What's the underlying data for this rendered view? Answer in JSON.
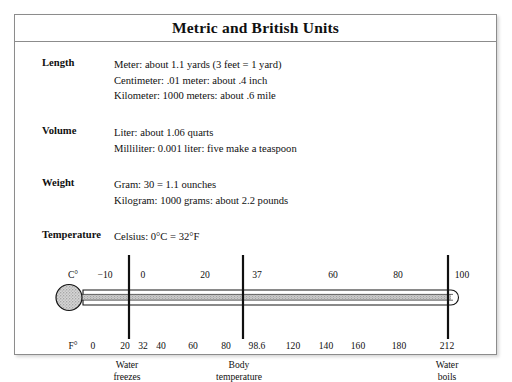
{
  "document": {
    "title": "Metric and British Units"
  },
  "groups": [
    {
      "label": "Length",
      "lines": [
        "Meter: about 1.1 yards (3 feet = 1 yard)",
        "Centimeter: .01 meter: about .4 inch",
        "Kilometer: 1000 meters: about .6 mile"
      ]
    },
    {
      "label": "Volume",
      "lines": [
        "Liter: about 1.06 quarts",
        "Milliliter: 0.001 liter: five make a teaspoon"
      ]
    },
    {
      "label": "Weight",
      "lines": [
        "Gram: 30 = 1.1 ounches",
        "Kilogram: 1000 grams: about 2.2 pounds"
      ]
    },
    {
      "label": "Temperature",
      "lines": [
        "Celsius: 0°C = 32°F"
      ]
    }
  ],
  "thermometer": {
    "celsius_axis_name": "C°",
    "fahrenheit_axis_name": "F°",
    "celsius_ticks": [
      {
        "label": "−10",
        "x": 90,
        "major": false
      },
      {
        "label": "0",
        "x": 128,
        "major": true
      },
      {
        "label": "20",
        "x": 190,
        "major": false
      },
      {
        "label": "37",
        "x": 242,
        "major": true
      },
      {
        "label": "60",
        "x": 318,
        "major": false
      },
      {
        "label": "80",
        "x": 383,
        "major": false
      },
      {
        "label": "100",
        "x": 447,
        "major": true
      }
    ],
    "fahrenheit_ticks": [
      {
        "label": "0",
        "x": 78
      },
      {
        "label": "20",
        "x": 110
      },
      {
        "label": "32",
        "x": 128
      },
      {
        "label": "40",
        "x": 146
      },
      {
        "label": "60",
        "x": 178
      },
      {
        "label": "80",
        "x": 211
      },
      {
        "label": "98.6",
        "x": 242
      },
      {
        "label": "120",
        "x": 278
      },
      {
        "label": "140",
        "x": 311
      },
      {
        "label": "160",
        "x": 343
      },
      {
        "label": "180",
        "x": 398
      },
      {
        "label": "212",
        "x": 446
      }
    ],
    "callouts": [
      {
        "line1": "Water",
        "line2": "freezes",
        "x": 126
      },
      {
        "line1": "Body",
        "line2": "temperature",
        "x": 238
      },
      {
        "line1": "Water",
        "line2": "boils",
        "x": 446
      }
    ],
    "colors": {
      "ink": "#101010",
      "bulb_fill": "#bdbdbd",
      "tube_fill": "#a8a8a8",
      "frame_border": "#8c8c8c"
    }
  }
}
